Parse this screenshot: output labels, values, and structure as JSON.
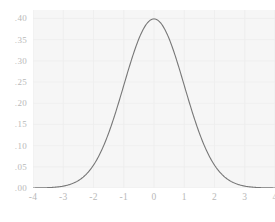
{
  "chart_data": {
    "type": "line",
    "title": "",
    "subtitle": "",
    "xlabel": "",
    "ylabel": "",
    "xlim": [
      -4,
      4
    ],
    "ylim": [
      0,
      0.42
    ],
    "grid": true,
    "legend": null,
    "legend_position": "none",
    "annotations": [],
    "x_tick_labels": [
      "-4",
      "-3",
      "-2",
      "-1",
      "0",
      "1",
      "2",
      "3",
      "4"
    ],
    "x_tick_values": [
      -4,
      -3,
      -2,
      -1,
      0,
      1,
      2,
      3,
      4
    ],
    "y_tick_labels": [
      ".00",
      ".05",
      ".10",
      ".15",
      ".20",
      ".25",
      ".30",
      ".35",
      ".40"
    ],
    "y_tick_values": [
      0,
      0.05,
      0.1,
      0.15,
      0.2,
      0.25,
      0.3,
      0.35,
      0.4
    ],
    "series": [
      {
        "name": "standard normal density",
        "distribution": "normal",
        "mean": 0,
        "sd": 1,
        "peak_value": 0.3989,
        "color": "#777777",
        "line_width": 1.1,
        "x": [
          -4,
          -3.8,
          -3.6,
          -3.4,
          -3.2,
          -3,
          -2.8,
          -2.6,
          -2.4,
          -2.2,
          -2,
          -1.8,
          -1.6,
          -1.4,
          -1.2,
          -1,
          -0.8,
          -0.6,
          -0.4,
          -0.2,
          0,
          0.2,
          0.4,
          0.6,
          0.8,
          1,
          1.2,
          1.4,
          1.6,
          1.8,
          2,
          2.2,
          2.4,
          2.6,
          2.8,
          3,
          3.2,
          3.4,
          3.6,
          3.8,
          4
        ],
        "values": [
          0.0001,
          0.0003,
          0.0006,
          0.0012,
          0.0024,
          0.0044,
          0.0079,
          0.0136,
          0.0224,
          0.0355,
          0.054,
          0.079,
          0.1109,
          0.1497,
          0.1942,
          0.242,
          0.2897,
          0.3332,
          0.3683,
          0.391,
          0.3989,
          0.391,
          0.3683,
          0.3332,
          0.2897,
          0.242,
          0.1942,
          0.1497,
          0.1109,
          0.079,
          0.054,
          0.0355,
          0.0224,
          0.0136,
          0.0079,
          0.0044,
          0.0024,
          0.0012,
          0.0006,
          0.0003,
          0.0001
        ]
      }
    ],
    "colors": {
      "panel_background": "#f6f6f6",
      "figure_background": "#ffffff",
      "grid": "#ededed",
      "tick_label": "#b9b9b9",
      "curve": "#777777"
    }
  }
}
